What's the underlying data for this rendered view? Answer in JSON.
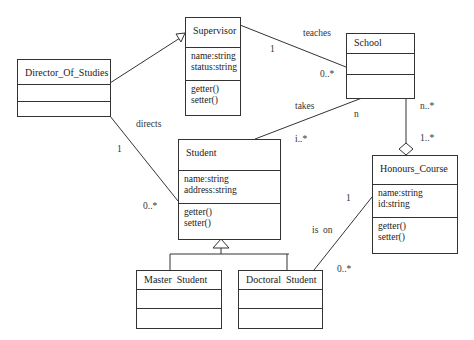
{
  "classes": {
    "director": {
      "name": "Director_Of_Studies",
      "attributes": [],
      "methods": []
    },
    "supervisor": {
      "name": "Supervisor",
      "attributes": [
        "name:string",
        "status:string"
      ],
      "methods": [
        "getter()",
        "setter()"
      ]
    },
    "school": {
      "name": "School",
      "attributes": [],
      "methods": []
    },
    "student": {
      "name": "Student",
      "attributes": [
        "name:string",
        "address:string"
      ],
      "methods": [
        "getter()",
        "setter()"
      ]
    },
    "honours": {
      "name": "Honours_Course",
      "attributes": [
        "name:string",
        "id:string"
      ],
      "methods": [
        "getter()",
        "setter()"
      ]
    },
    "master": {
      "name": "Master  Student",
      "attributes": [],
      "methods": []
    },
    "doctoral": {
      "name": "Doctoral  Student",
      "attributes": [],
      "methods": []
    }
  },
  "associations": {
    "teaches": {
      "label": "teaches",
      "end1": "1",
      "end2": "0..*"
    },
    "takes": {
      "label": "takes",
      "end1": "n",
      "end2": "i..*"
    },
    "directs": {
      "label": "directs",
      "end1": "1",
      "end2": "0..*"
    },
    "aggregation": {
      "end1": "n..*",
      "end2": "1..*"
    },
    "is_on": {
      "label": "is  on",
      "end1": "1",
      "end2": "0..*"
    }
  }
}
